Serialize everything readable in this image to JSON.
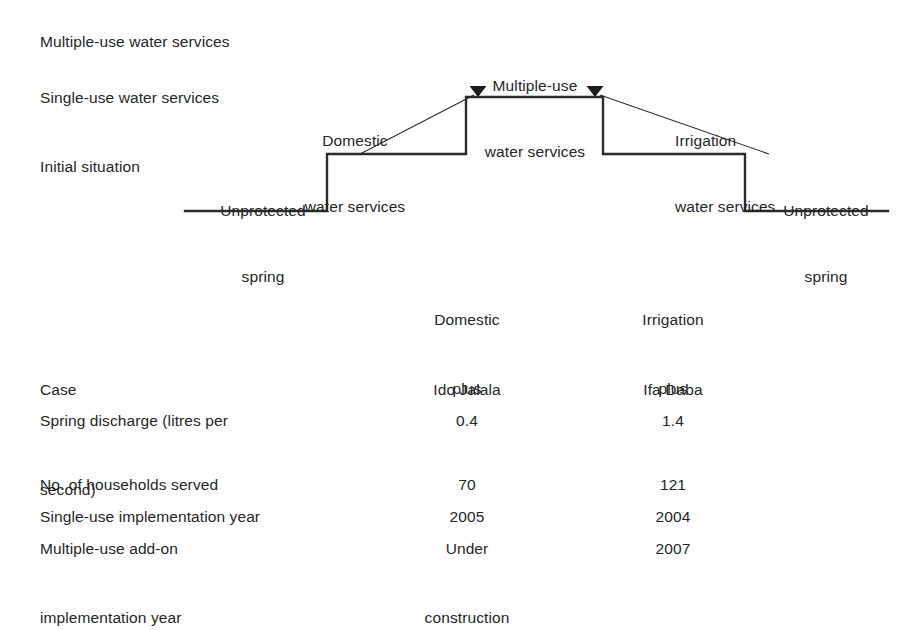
{
  "diagram": {
    "tier_labels": [
      {
        "id": "multiple",
        "text": "Multiple-use water services"
      },
      {
        "id": "single",
        "text": "Single-use water services"
      },
      {
        "id": "initial",
        "text": "Initial situation"
      }
    ],
    "callouts": {
      "unprotected_left_line1": "Unprotected",
      "unprotected_left_line2": "spring",
      "domestic_line1": "Domestic",
      "domestic_line2": "water services",
      "multiple_center_line1": "Multiple-use",
      "multiple_center_line2": "water services",
      "irrigation_line1": "Irrigation",
      "irrigation_line2": "water services",
      "unprotected_right_line1": "Unprotected",
      "unprotected_right_line2": "spring"
    },
    "stroke_color": "#2b2b2b",
    "stroke_width": 2.4,
    "leader_stroke_width": 1.1,
    "step_path": "M185,211 L327,211 L327,154 L466,154 L466,97 L603,97 L603,154 L745,154 L745,211 L888,211",
    "leader_domestic": "M360,154 L474,95",
    "leader_irrigation": "M769,154 L600,95",
    "arrow_left_x": 478,
    "arrow_right_x": 595,
    "arrow_y": 91
  },
  "table": {
    "column_headers": [
      {
        "line1": "Domestic",
        "line2": "plus"
      },
      {
        "line1": "Irrigation",
        "line2": "plus"
      }
    ],
    "rows": [
      {
        "label_line1": "Case",
        "label_line2": "",
        "a_line1": "Ido Jalala",
        "a_line2": "",
        "b_line1": "Ifa Daba",
        "b_line2": ""
      },
      {
        "label_line1": "Spring discharge (litres per",
        "label_line2": "second)",
        "a_line1": "0.4",
        "a_line2": "",
        "b_line1": "1.4",
        "b_line2": ""
      },
      {
        "label_line1": "No. of households served",
        "label_line2": "",
        "a_line1": "70",
        "a_line2": "",
        "b_line1": "121",
        "b_line2": ""
      },
      {
        "label_line1": "Single-use implementation year",
        "label_line2": "",
        "a_line1": "2005",
        "a_line2": "",
        "b_line1": "2004",
        "b_line2": ""
      },
      {
        "label_line1": "Multiple-use add-on",
        "label_line2": "implementation year",
        "a_line1": "Under",
        "a_line2": "construction",
        "b_line1": "2007",
        "b_line2": ""
      }
    ]
  }
}
